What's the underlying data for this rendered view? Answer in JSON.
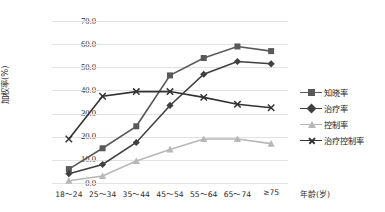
{
  "chart_data": {
    "type": "line",
    "title": "",
    "xlabel": "年龄(岁)",
    "ylabel": "加权率(%)",
    "categories": [
      "18～24",
      "25～34",
      "35～44",
      "45～54",
      "55～64",
      "65～74",
      "≥75"
    ],
    "ylim": [
      0,
      70
    ],
    "ytick_labels": [
      "0.0",
      "10.0",
      "20.0",
      "30.0",
      "40.0",
      "50.0",
      "60.0",
      "70.0"
    ],
    "ytick_values": [
      0,
      10,
      20,
      30,
      40,
      50,
      60,
      70
    ],
    "grid": true,
    "legend_position": "right",
    "series": [
      {
        "name": "知晓率",
        "marker": "square",
        "color": "#595959",
        "values": [
          6.0,
          15.0,
          24.5,
          46.5,
          54.0,
          59.0,
          57.0
        ]
      },
      {
        "name": "治疗率",
        "marker": "diamond",
        "color": "#404040",
        "values": [
          4.0,
          8.0,
          17.5,
          33.5,
          47.0,
          52.5,
          51.5
        ]
      },
      {
        "name": "控制率",
        "marker": "triangle",
        "color": "#b7b7b7",
        "values": [
          1.0,
          3.0,
          9.5,
          14.5,
          19.0,
          19.0,
          17.0
        ]
      },
      {
        "name": "治疗控制率",
        "marker": "cross",
        "color": "#333333",
        "values": [
          19.0,
          37.5,
          39.5,
          39.5,
          37.0,
          34.0,
          32.5
        ]
      }
    ]
  }
}
